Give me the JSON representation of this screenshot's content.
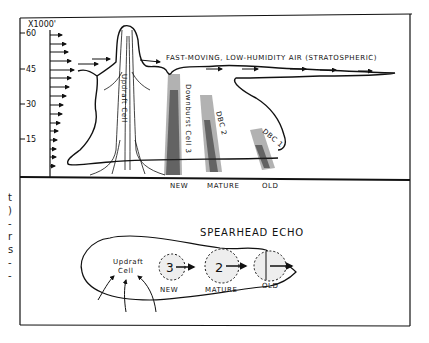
{
  "diagram": {
    "axis": {
      "unit_label": "X1000'",
      "ticks": [
        {
          "label": "60",
          "y": 33
        },
        {
          "label": "45",
          "y": 69
        },
        {
          "label": "30",
          "y": 104
        },
        {
          "label": "15",
          "y": 139
        }
      ]
    },
    "top_panel": {
      "airflow_label": "FAST-MOVING, LOW-HUMIDITY AIR (STRATOSPHERIC)",
      "updraft_label": "Updraft Cell",
      "downburst_cells": [
        {
          "label": "Downburst Cell 3",
          "stage": "NEW"
        },
        {
          "label": "DBC 2",
          "stage": "MATURE"
        },
        {
          "label": "DBC 1",
          "stage": "OLD"
        }
      ]
    },
    "bottom_panel": {
      "title": "SPEARHEAD ECHO",
      "updraft_label_line1": "Updraft",
      "updraft_label_line2": "Cell",
      "cells": [
        {
          "number": "3",
          "stage": "NEW"
        },
        {
          "number": "2",
          "stage": "MATURE"
        },
        {
          "number": "1",
          "stage": "OLD"
        }
      ]
    },
    "left_margin_fragments": [
      "t",
      ")",
      "-",
      "r",
      "s",
      "-",
      "-"
    ]
  }
}
